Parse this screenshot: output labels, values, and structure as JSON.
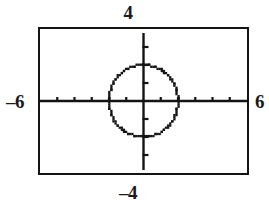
{
  "figure": {
    "background_color": "#ffffff",
    "ink_color": "#141414"
  },
  "labels": {
    "top": "4",
    "bottom": "–4",
    "left": "–6",
    "right": "6"
  },
  "chart_data": {
    "type": "scatter",
    "title": "",
    "subtitle": "",
    "xlabel": "",
    "ylabel": "",
    "grid": false,
    "legend": null,
    "legend_position": "none",
    "style": "graphing-calculator-viewing-window",
    "xlim": [
      -6,
      6
    ],
    "ylim": [
      -4,
      4
    ],
    "xticks": [
      -5,
      -4,
      -3,
      -2,
      -1,
      0,
      1,
      2,
      3,
      4,
      5
    ],
    "yticks": [
      -3,
      -2,
      -1,
      0,
      1,
      2,
      3
    ],
    "xtick_labels": [
      "",
      "",
      "",
      "",
      "",
      "",
      "",
      "",
      "",
      "",
      ""
    ],
    "ytick_labels": [
      "",
      "",
      "",
      "",
      "",
      "",
      ""
    ],
    "axis_end_labels": {
      "xmin": "–6",
      "xmax": "6",
      "ymin": "–4",
      "ymax": "4"
    },
    "series": [
      {
        "name": "circle",
        "type": "implicit-curve",
        "equation": "x^2 + y^2 = 4",
        "center": [
          0,
          0
        ],
        "radius": 2,
        "rendering": "dotted",
        "color": "#141414"
      }
    ],
    "annotations": []
  }
}
